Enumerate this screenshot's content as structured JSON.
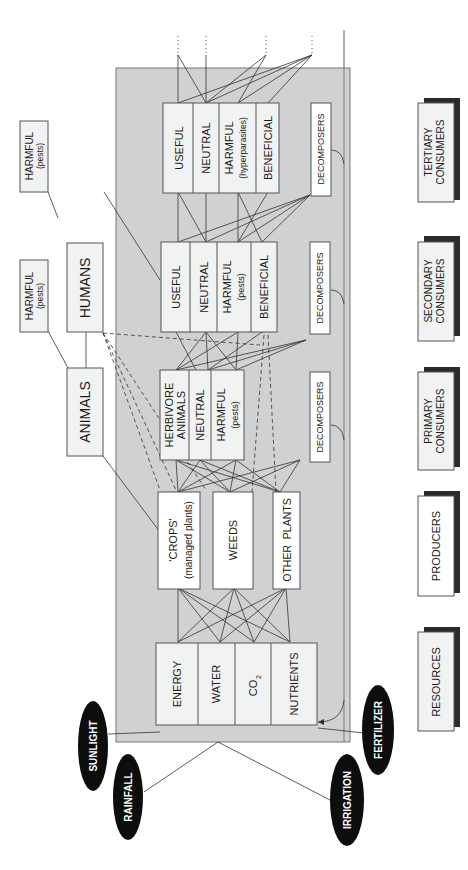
{
  "levels": [
    {
      "id": "tertiary",
      "label_line1": "TERTIARY",
      "label_line2": "CONSUMERS"
    },
    {
      "id": "secondary",
      "label_line1": "SECONDARY",
      "label_line2": "CONSUMERS"
    },
    {
      "id": "primary",
      "label_line1": "PRIMARY",
      "label_line2": "CONSUMERS"
    },
    {
      "id": "producers",
      "label_line1": "PRODUCERS",
      "label_line2": ""
    },
    {
      "id": "resources",
      "label_line1": "RESOURCES",
      "label_line2": ""
    }
  ],
  "inputs": [
    {
      "id": "sunlight",
      "label": "SUNLIGHT"
    },
    {
      "id": "rainfall",
      "label": "RAINFALL"
    },
    {
      "id": "irrigation",
      "label": "IRRIGATION"
    },
    {
      "id": "fertilizer",
      "label": "FERTILIZER"
    }
  ],
  "resources": [
    {
      "label": "ENERGY"
    },
    {
      "label": "WATER"
    },
    {
      "label": "CO",
      "sub": "2"
    },
    {
      "label": "NUTRIENTS"
    }
  ],
  "producers": [
    {
      "label": "'CROPS'",
      "sub": "(managed plants)"
    },
    {
      "label": "WEEDS"
    },
    {
      "label": "OTHER  PLANTS"
    }
  ],
  "primary_consumers": [
    {
      "label": "HERBIVORE",
      "label2": "ANIMALS"
    },
    {
      "label": "NEUTRAL"
    },
    {
      "label": "HARMFUL",
      "sub": "(pests)"
    }
  ],
  "secondary_consumers": [
    {
      "label": "USEFUL"
    },
    {
      "label": "NEUTRAL"
    },
    {
      "label": "HARMFUL",
      "sub": "(pests)"
    },
    {
      "label": "BENEFICIAL"
    }
  ],
  "tertiary_consumers": [
    {
      "label": "USEFUL"
    },
    {
      "label": "NEUTRAL"
    },
    {
      "label": "HARMFUL",
      "sub": "(hyperparasites)"
    },
    {
      "label": "BENEFICIAL"
    }
  ],
  "decomposers": {
    "label": "DECOMPOSERS"
  },
  "outside": {
    "animals": "ANIMALS",
    "humans": "HUMANS",
    "harmful_animals": {
      "label": "HARMFUL",
      "sub": "(pests)"
    },
    "harmful_humans": {
      "label": "HARMFUL",
      "sub": "(pests)"
    }
  },
  "colors": {
    "system_bg": "#cfd1d3",
    "box_fill": "#f1f2f2",
    "oval_fill": "#0d0d0d",
    "shadow": "#2a2a2a"
  }
}
